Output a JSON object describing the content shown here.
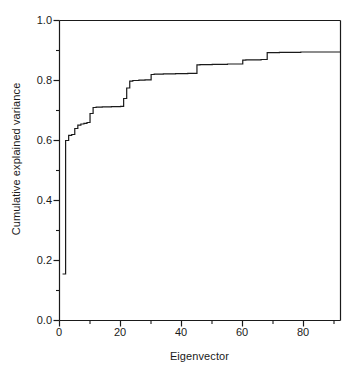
{
  "chart_data": {
    "type": "line",
    "title": "",
    "subtitle": "",
    "xlabel": "Eigenvector",
    "ylabel": "Cumulative explained variance",
    "xlim": [
      0,
      92
    ],
    "ylim": [
      0.0,
      1.0
    ],
    "grid": false,
    "legend": null,
    "line_style": "step",
    "line_color": "#1a1a1a",
    "xticks": [
      0,
      20,
      40,
      60,
      80
    ],
    "xtick_labels": [
      "0",
      "20",
      "40",
      "60",
      "80"
    ],
    "xminor_ticks": [
      10,
      30,
      50,
      70,
      90
    ],
    "yticks": [
      0.0,
      0.2,
      0.4,
      0.6,
      0.8,
      1.0
    ],
    "ytick_labels": [
      "0.0",
      "0.2",
      "0.4",
      "0.6",
      "0.8",
      "1.0"
    ],
    "yminor_ticks": [
      0.1,
      0.3,
      0.5,
      0.7,
      0.9
    ],
    "x": [
      1,
      2,
      3,
      4,
      5,
      6,
      7,
      8,
      9,
      10,
      11,
      12,
      13,
      14,
      15,
      16,
      17,
      18,
      19,
      20,
      21,
      22,
      23,
      24,
      25,
      26,
      27,
      28,
      29,
      30,
      31,
      32,
      33,
      34,
      35,
      36,
      37,
      38,
      39,
      40,
      41,
      42,
      43,
      44,
      45,
      46,
      47,
      48,
      49,
      50,
      51,
      52,
      53,
      54,
      55,
      56,
      57,
      58,
      59,
      60,
      61,
      62,
      63,
      64,
      65,
      66,
      67,
      68,
      69,
      70,
      71,
      72,
      73,
      74,
      75,
      76,
      77,
      78,
      79,
      80,
      81,
      82,
      83,
      84,
      85,
      86,
      87,
      88,
      89,
      90,
      91,
      92
    ],
    "y": [
      0.155,
      0.6,
      0.617,
      0.62,
      0.64,
      0.651,
      0.655,
      0.657,
      0.66,
      0.69,
      0.71,
      0.711,
      0.711,
      0.712,
      0.712,
      0.712,
      0.713,
      0.713,
      0.713,
      0.714,
      0.74,
      0.775,
      0.798,
      0.8,
      0.8,
      0.801,
      0.801,
      0.802,
      0.802,
      0.82,
      0.821,
      0.821,
      0.821,
      0.822,
      0.822,
      0.822,
      0.822,
      0.823,
      0.823,
      0.823,
      0.823,
      0.824,
      0.824,
      0.824,
      0.852,
      0.853,
      0.853,
      0.853,
      0.853,
      0.854,
      0.854,
      0.854,
      0.854,
      0.854,
      0.855,
      0.855,
      0.855,
      0.855,
      0.855,
      0.868,
      0.869,
      0.869,
      0.869,
      0.869,
      0.869,
      0.87,
      0.87,
      0.893,
      0.893,
      0.893,
      0.893,
      0.894,
      0.894,
      0.894,
      0.894,
      0.894,
      0.894,
      0.894,
      0.895,
      0.895,
      0.895,
      0.895,
      0.895,
      0.895,
      0.895,
      0.895,
      0.895,
      0.895,
      0.895,
      0.895,
      0.895,
      0.895
    ]
  },
  "axes": {
    "ylabel_text": "Cumulative explained variance",
    "xlabel_text": "Eigenvector",
    "ytick_0": "0.0",
    "ytick_1": "0.2",
    "ytick_2": "0.4",
    "ytick_3": "0.6",
    "ytick_4": "0.8",
    "ytick_5": "1.0",
    "xtick_0": "0",
    "xtick_1": "20",
    "xtick_2": "40",
    "xtick_3": "60",
    "xtick_4": "80"
  },
  "style": {
    "axis_color": "#1a1a1a",
    "line_color": "#1a1a1a",
    "background": "#ffffff"
  }
}
